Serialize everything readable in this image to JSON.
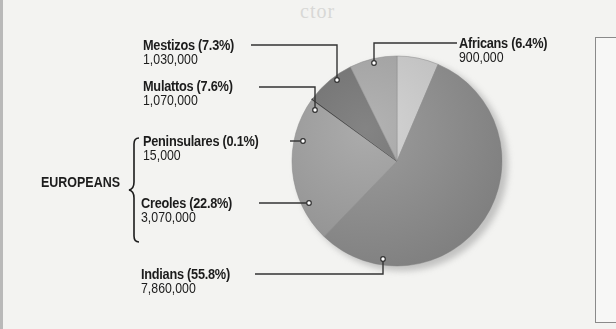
{
  "chart_data": {
    "type": "pie",
    "title": "",
    "slices": [
      {
        "label": "Africans",
        "percent": 6.4,
        "value": 900000,
        "value_label": "900,000",
        "color": "#cfcfcf"
      },
      {
        "label": "Indians",
        "percent": 55.8,
        "value": 7860000,
        "value_label": "7,860,000",
        "color": "#8f8f8f"
      },
      {
        "label": "Creoles",
        "percent": 22.8,
        "value": 3070000,
        "value_label": "3,070,000",
        "color": "#a0a0a0",
        "group": "EUROPEANS"
      },
      {
        "label": "Peninsulares",
        "percent": 0.1,
        "value": 15000,
        "value_label": "15,000",
        "color": "#b8b8b8",
        "group": "EUROPEANS"
      },
      {
        "label": "Mulattos",
        "percent": 7.6,
        "value": 1070000,
        "value_label": "1,070,000",
        "color": "#737373"
      },
      {
        "label": "Mestizos",
        "percent": 7.3,
        "value": 1030000,
        "value_label": "1,030,000",
        "color": "#a9a9a9"
      }
    ],
    "groups": [
      {
        "name": "EUROPEANS",
        "members": [
          "Peninsulares",
          "Creoles"
        ]
      }
    ],
    "legend": "callout labels",
    "center": [
      397,
      161
    ],
    "radius": 105
  },
  "labels": {
    "mestizos": {
      "name": "Mestizos (7.3%)",
      "value": "1,030,000"
    },
    "mulattos": {
      "name": "Mulattos (7.6%)",
      "value": "1,070,000"
    },
    "peninsulares": {
      "name": "Peninsulares (0.1%)",
      "value": "15,000"
    },
    "creoles": {
      "name": "Creoles (22.8%)",
      "value": "3,070,000"
    },
    "indians": {
      "name": "Indians (55.8%)",
      "value": "7,860,000"
    },
    "africans": {
      "name": "Africans (6.4%)",
      "value": "900,000"
    },
    "group": "EUROPEANS"
  },
  "background_bleed_text": "ctor"
}
